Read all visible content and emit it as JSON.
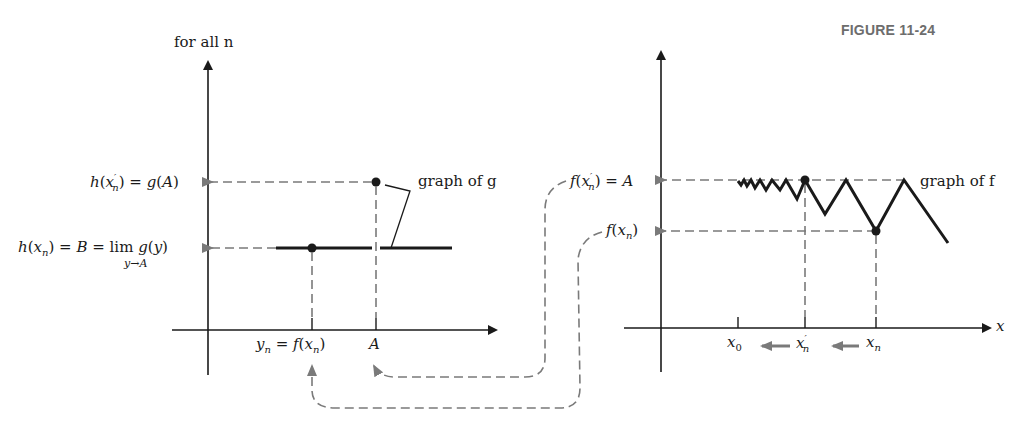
{
  "figure": {
    "label": "FIGURE 11-24"
  },
  "left_graph": {
    "top_label": "for all n",
    "y_labels": {
      "h_xprime": "h(x′ₙ) = g(A)",
      "h_xprime_parts": [
        "h",
        "(",
        "x",
        "′",
        "n",
        ") = ",
        "g",
        "(",
        "A",
        ")"
      ],
      "h_x": "h(xₙ) = B = lim g(y)",
      "h_x_parts": [
        "h",
        "(",
        "x",
        "n",
        ") = ",
        "B",
        " = lim ",
        "g",
        "(",
        "y",
        ")"
      ],
      "lim_sub": "y→A"
    },
    "x_labels": {
      "yn": "yₙ = f(xₙ)",
      "yn_parts": [
        "y",
        "n",
        " = ",
        "f",
        "(",
        "x",
        "n",
        ")"
      ],
      "A": "A"
    },
    "annotation": "graph of g"
  },
  "right_graph": {
    "y_labels": {
      "f_xprime": "f(x′ₙ) = A",
      "f_xprime_parts": [
        "f",
        "(",
        "x",
        "′",
        "n",
        ") = ",
        "A"
      ],
      "f_x": "f(xₙ)",
      "f_x_parts": [
        "f",
        "(",
        "x",
        "n",
        ")"
      ]
    },
    "x_labels": {
      "x0": "x₀",
      "x0_parts": [
        "x",
        "0"
      ],
      "xprime": "x′ₙ",
      "xprime_parts": [
        "x",
        "′",
        "n"
      ],
      "xn": "xₙ",
      "xn_parts": [
        "x",
        "n"
      ],
      "axis": "x"
    },
    "annotation": "graph of f"
  },
  "colors": {
    "ink": "#1a1a1a",
    "dashed": "#7a7a7a",
    "title": "#6d6d6d"
  }
}
